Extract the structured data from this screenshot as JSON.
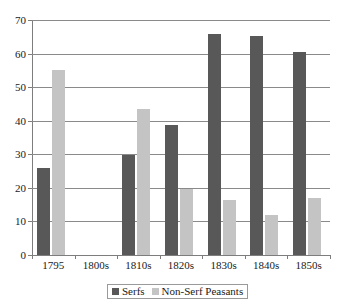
{
  "chart_data": {
    "type": "bar",
    "title": "",
    "subtitle": "",
    "xlabel": "",
    "ylabel": "",
    "categories": [
      "1795",
      "1800s",
      "1810s",
      "1820s",
      "1830s",
      "1840s",
      "1850s"
    ],
    "series": [
      {
        "name": "Serfs",
        "color": "#585858",
        "values": [
          26,
          null,
          29.7,
          38.6,
          65.7,
          65.1,
          60.5
        ]
      },
      {
        "name": "Non-Serf Peasants",
        "color": "#c4c4c4",
        "values": [
          55.2,
          null,
          43.5,
          19.7,
          16.4,
          11.8,
          17.0
        ]
      }
    ],
    "ylim": [
      0,
      70
    ],
    "ytick_labels": [
      "0",
      "10",
      "20",
      "30",
      "40",
      "50",
      "60",
      "70"
    ],
    "ytick_values": [
      0,
      10,
      20,
      30,
      40,
      50,
      60,
      70
    ],
    "grid": "horizontal",
    "legend_position": "bottom-center",
    "legend_entries": [
      "Serfs",
      "Non-Serf Peasants"
    ],
    "annotations": []
  },
  "axes": {
    "y_axis_name": "y-axis",
    "x_axis_name": "x-axis"
  }
}
